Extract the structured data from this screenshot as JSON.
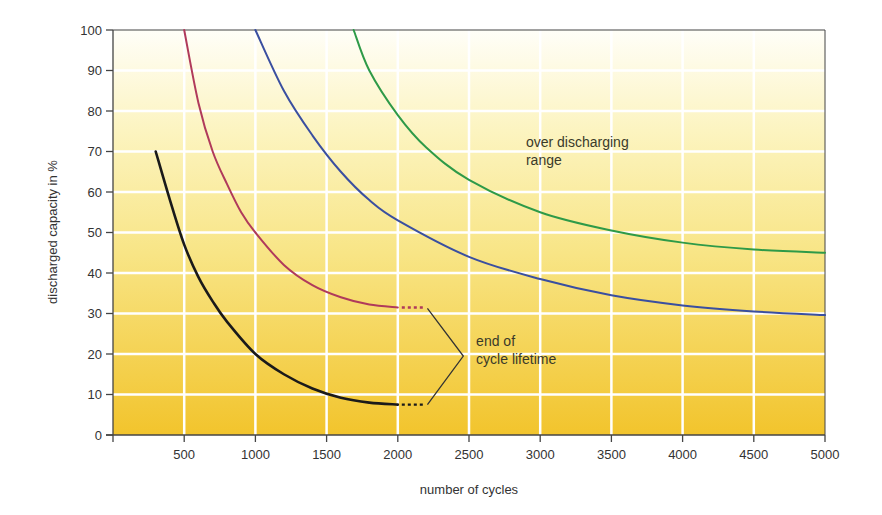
{
  "chart_data": {
    "type": "line",
    "title": "",
    "xlabel": "number of cycles",
    "ylabel": "discharged capacity in %",
    "xlim": [
      0,
      5000
    ],
    "ylim": [
      0,
      100
    ],
    "x_ticks": [
      500,
      1000,
      1500,
      2000,
      2500,
      3000,
      3500,
      4000,
      4500,
      5000
    ],
    "y_ticks": [
      0,
      10,
      20,
      30,
      40,
      50,
      60,
      70,
      80,
      90,
      100
    ],
    "grid": true,
    "legend": null,
    "series": [
      {
        "name": "black",
        "color": "#1a1a1a",
        "x": [
          300,
          400,
          500,
          600,
          700,
          800,
          1000,
          1200,
          1400,
          1600,
          1800,
          2000
        ],
        "values": [
          70,
          58,
          47,
          39,
          33,
          28,
          20,
          15,
          11.5,
          9.2,
          8,
          7.5
        ],
        "dotted_extension": {
          "x": [
            2000,
            2180
          ],
          "values": [
            7.5,
            7.5
          ]
        }
      },
      {
        "name": "red",
        "color": "#b03a5b",
        "x": [
          500,
          600,
          700,
          800,
          900,
          1000,
          1200,
          1400,
          1600,
          1800,
          2000
        ],
        "values": [
          100,
          82,
          70,
          62,
          55,
          50,
          42,
          37,
          34,
          32.2,
          31.5
        ],
        "dotted_extension": {
          "x": [
            2000,
            2180
          ],
          "values": [
            31.5,
            31.5
          ]
        }
      },
      {
        "name": "blue",
        "color": "#3a4fa0",
        "x": [
          1000,
          1200,
          1400,
          1600,
          1800,
          2000,
          2500,
          3000,
          3500,
          4000,
          4500,
          5000
        ],
        "values": [
          100,
          85,
          74,
          65,
          58,
          53,
          44,
          38.5,
          34.5,
          32,
          30.5,
          29.6
        ]
      },
      {
        "name": "green",
        "color": "#2e9a48",
        "x": [
          1690,
          1800,
          2000,
          2200,
          2500,
          3000,
          3500,
          4000,
          4500,
          5000
        ],
        "values": [
          100,
          90,
          79,
          71,
          63,
          55,
          50.5,
          47.5,
          45.8,
          45
        ]
      }
    ],
    "annotations": [
      {
        "text_lines": [
          "over discharging",
          "range"
        ],
        "x": 2900,
        "y": 71
      },
      {
        "text_lines": [
          "end of",
          "cycle lifetime"
        ],
        "x": 2550,
        "y": 22
      }
    ],
    "colors": {
      "background_top": "#fffef6",
      "background_mid": "#f9ec9a",
      "background_bottom": "#f2c42c",
      "grid": "#ffffff",
      "axis": "#444444"
    }
  }
}
